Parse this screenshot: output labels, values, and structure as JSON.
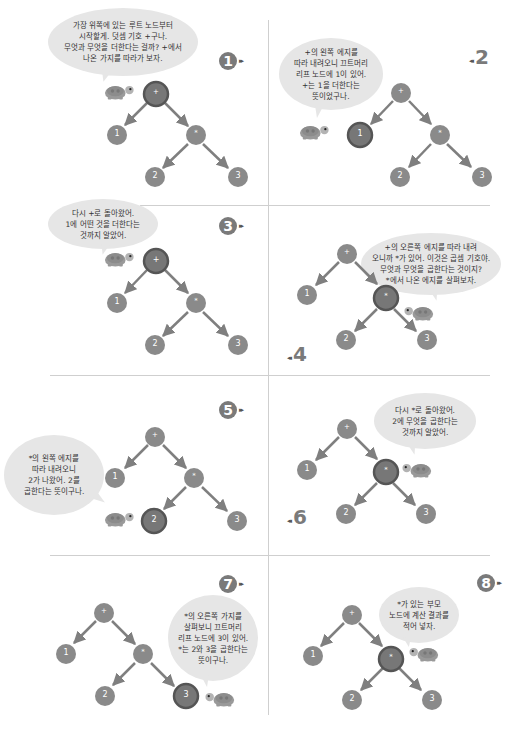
{
  "diagram": {
    "colors": {
      "node": "#8a8a8a",
      "node_active": "#6e6e6e",
      "node_active_ring": "#555555",
      "edge": "#7f7f7f",
      "bubble": "#e6e6e6",
      "divider": "#cfcfcf"
    },
    "tree": {
      "root": {
        "label": "+",
        "children": [
          "1",
          "*"
        ]
      },
      "mult": {
        "label": "*",
        "children": [
          "2",
          "3"
        ]
      },
      "leaves": [
        "1",
        "2",
        "3"
      ]
    },
    "nodes": {
      "root": "+",
      "left": "1",
      "mult": "*",
      "two": "2",
      "three": "3"
    },
    "panels": [
      {
        "step": "1",
        "active_node": "+",
        "speech": "가장 위쪽에 있는 루트 노드부터\n시작할게. 덧셈 기호 +구나.\n무엇과 무엇을 더한다는 걸까? +에서\n나온 가지를 따라가 보자."
      },
      {
        "step": "2",
        "active_node": "1",
        "speech": "+의 왼쪽 에지를\n따라 내려오니 끄트머리\n리프 노드에 1이 있어.\n+는 1을 더한다는\n뜻이었구나."
      },
      {
        "step": "3",
        "active_node": "+",
        "speech": "다시 +로 돌아왔어.\n1에 어떤 것을 더한다는\n것까지 알았어."
      },
      {
        "step": "4",
        "active_node": "*",
        "speech": "+의 오른쪽 에지를 따라 내려\n오니까 *가 있어. 이것은 곱셈 기호야.\n무엇과 무엇을 곱한다는 것이지?\n*에서 나온 에지를 살펴보자."
      },
      {
        "step": "5",
        "active_node": "2",
        "speech": "*의 왼쪽 에지를\n따라 내려오니\n2가 나왔어. 2를\n곱한다는 뜻이구나."
      },
      {
        "step": "6",
        "active_node": "*",
        "speech": "다시 *로 돌아왔어.\n2에 무엇을 곱한다는\n것까지 알았어."
      },
      {
        "step": "7",
        "active_node": "3",
        "speech": "*의 오른쪽 가지를\n살펴보니 끄트머리\n리프 노드에 3이 있어.\n*는 2와 3을 곱한다는\n뜻이구나."
      },
      {
        "step": "8",
        "active_node": "*",
        "speech": "*가 있는 부모\n노드에 계산 결과를\n적어 넣자."
      }
    ],
    "arrow_glyph": "▸▸",
    "arrow_glyph_rev": "◂◂"
  }
}
